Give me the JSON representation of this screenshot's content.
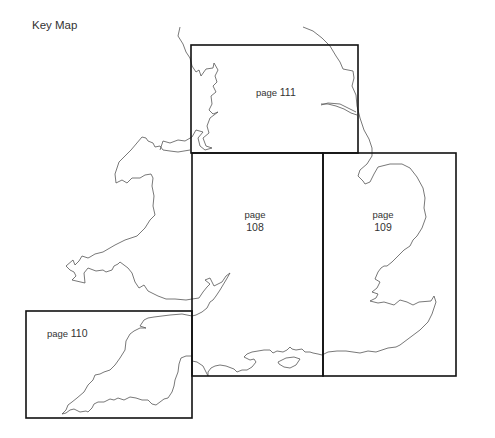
{
  "title": "Key Map",
  "pages": [
    {
      "id": "111",
      "prefix": "page",
      "number": "111",
      "box": {
        "x": 191,
        "y": 45,
        "w": 167,
        "h": 108
      }
    },
    {
      "id": "108",
      "prefix": "page",
      "number": "108",
      "box": {
        "x": 192,
        "y": 153,
        "w": 131,
        "h": 223
      }
    },
    {
      "id": "109",
      "prefix": "page",
      "number": "109",
      "box": {
        "x": 323,
        "y": 153,
        "w": 133,
        "h": 223
      }
    },
    {
      "id": "110",
      "prefix": "page",
      "number": "110",
      "box": {
        "x": 26,
        "y": 311,
        "w": 166,
        "h": 107
      }
    }
  ],
  "colors": {
    "box_stroke": "#111111",
    "coastline": "#555555",
    "background": "#ffffff"
  }
}
